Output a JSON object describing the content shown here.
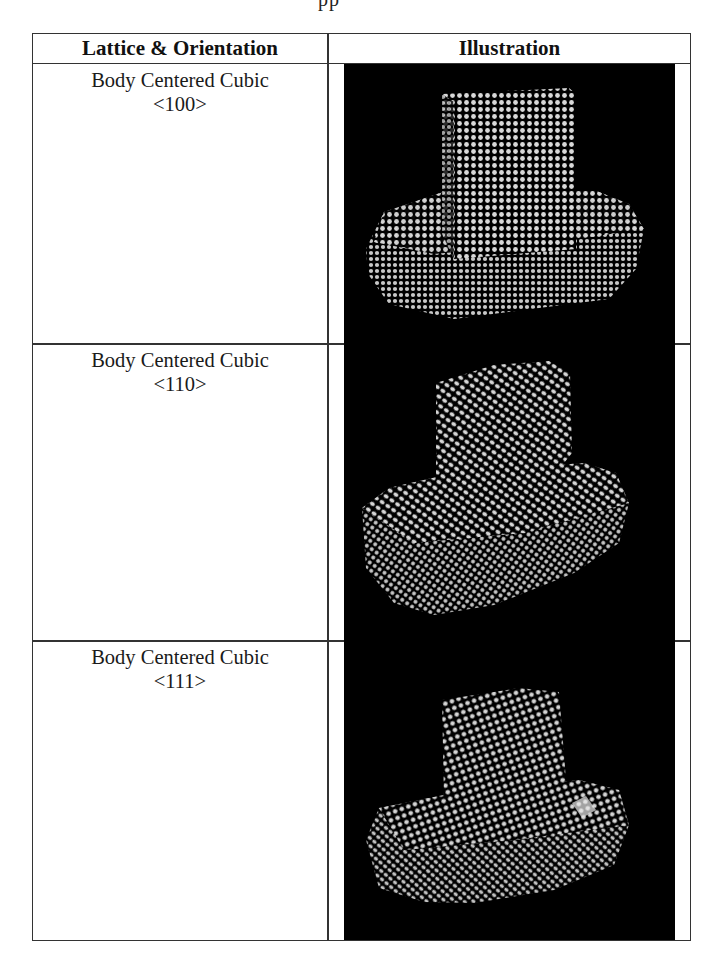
{
  "page": {
    "fragment_text": "pp"
  },
  "table": {
    "headers": {
      "lattice": "Lattice & Orientation",
      "illustration": "Illustration"
    },
    "rows": [
      {
        "lattice": "Body Centered Cubic",
        "orientation": "<100>",
        "illustration": "bcc-100-lattice-render"
      },
      {
        "lattice": "Body Centered Cubic",
        "orientation": "<110>",
        "illustration": "bcc-110-lattice-render"
      },
      {
        "lattice": "Body Centered Cubic",
        "orientation": "<111>",
        "illustration": "bcc-111-lattice-render"
      }
    ]
  },
  "colors": {
    "border": "#333333",
    "panel_background": "#000000",
    "atom": "#d9d9d9",
    "text": "#111111"
  }
}
